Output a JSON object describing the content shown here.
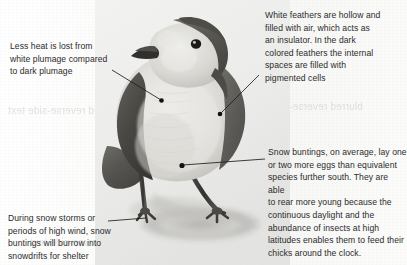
{
  "figure": {
    "background_color": "#fbfbfa",
    "text_color": "#2b2b2b",
    "leader_color": "#1d1d1d"
  },
  "annotations": [
    {
      "id": "heat-loss",
      "name": "annotation-heat-loss",
      "text": "Less heat is lost from white plumage compared to dark plumage",
      "lines": [
        "Less heat is lost from",
        "white plumage compared",
        "to dark plumage"
      ]
    },
    {
      "id": "feather-structure",
      "name": "annotation-feather-structure",
      "text": "White feathers are hollow and filled with air, which acts as an insulator. In the dark colored feathers the internal spaces are filled with pigmented cells",
      "lines": [
        "White feathers are hollow and",
        "filled with air, which acts as",
        "an insulator. In the dark",
        "colored feathers the internal",
        "spaces are filled with",
        "pigmented cells"
      ]
    },
    {
      "id": "clutch-size",
      "name": "annotation-clutch-size",
      "text": "Snow buntings, on average, lay one or two more eggs than equivalent species further south. They are able to rear more young because the continuous daylight and the abundance of insects at high latitudes enables them to feed their chicks around the clock.",
      "lines": [
        "Snow buntings, on average, lay one",
        "or two more eggs than equivalent",
        "species further south. They are able",
        "to rear more young because the",
        "continuous daylight and the",
        "abundance of insects at high",
        "latitudes enables them to feed their",
        "chicks around the clock."
      ]
    },
    {
      "id": "snow-burrowing",
      "name": "annotation-snow-burrowing",
      "text": "During snow storms or periods of high wind, snow buntings will burrow into snowdrifts for shelter",
      "lines": [
        "During snow storms or",
        "periods of high wind, snow",
        "buntings will burrow into",
        "snowdrifts for shelter"
      ]
    }
  ],
  "ghost_text": {
    "g1": "blurred reverse-side text",
    "g2": "blurred reverse-side text",
    "g3": "blurred reverse-side text",
    "g4": "blurred reverse-side text"
  }
}
